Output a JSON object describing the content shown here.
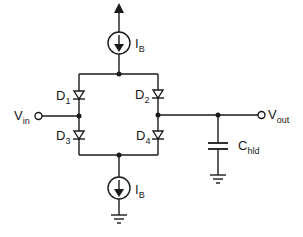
{
  "diagram": {
    "type": "circuit-schematic",
    "components": {
      "top_current_source": {
        "label": "I",
        "subscript": "B",
        "direction": "down"
      },
      "bottom_current_source": {
        "label": "I",
        "subscript": "B",
        "direction": "down"
      },
      "d1": {
        "label": "D",
        "subscript": "1"
      },
      "d2": {
        "label": "D",
        "subscript": "2"
      },
      "d3": {
        "label": "D",
        "subscript": "3"
      },
      "d4": {
        "label": "D",
        "subscript": "4"
      },
      "capacitor": {
        "label": "C",
        "subscript": "hld"
      }
    },
    "terminals": {
      "input": {
        "label": "V",
        "subscript": "in"
      },
      "output": {
        "label": "V",
        "subscript": "out"
      }
    },
    "colors": {
      "wire": "#1a1a1a",
      "background": "#ffffff"
    }
  }
}
